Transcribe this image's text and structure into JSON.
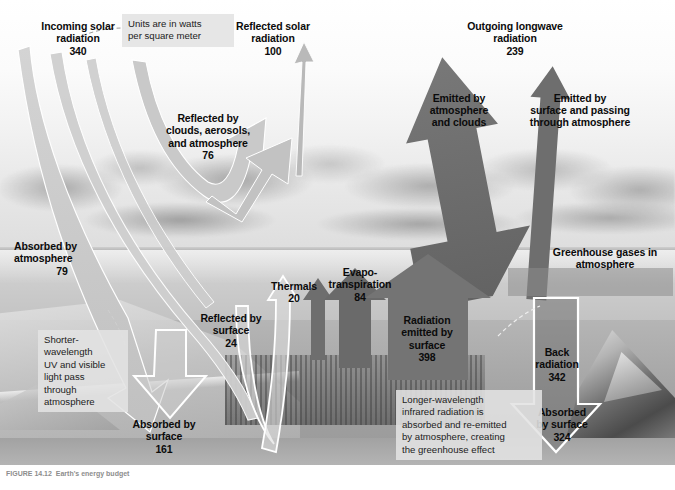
{
  "figure": {
    "units_note": "Units are in watts\nper square meter",
    "caption": "FIGURE 14.12  Earth's energy budget",
    "colors": {
      "incoming_solar_arrow": "#c9c9c9",
      "reflected_solar_arrow": "#c4c4c4",
      "longwave_arrow": "#6e6e6e",
      "surface_emission_arrow": "#7a7a7a",
      "back_radiation_outline": "#ffffff",
      "note_box": "#e2e2e2",
      "label_text": "#0b0b0b"
    }
  },
  "flows": [
    {
      "id": "incoming-solar",
      "label": "Incoming solar\nradiation",
      "value": "340",
      "direction": "down",
      "tone": "light"
    },
    {
      "id": "reflected-solar",
      "label": "Reflected solar\nradiation",
      "value": "100",
      "direction": "up",
      "tone": "light"
    },
    {
      "id": "reflected-by-clouds",
      "label": "Reflected by\nclouds, aerosols,\nand atmosphere",
      "value": "76",
      "direction": "up",
      "tone": "light"
    },
    {
      "id": "outgoing-longwave",
      "label": "Outgoing longwave\nradiation",
      "value": "239",
      "direction": "up",
      "tone": "dark"
    },
    {
      "id": "emitted-by-atmosphere",
      "label": "Emitted by\natmosphere\nand clouds",
      "value": "",
      "direction": "up",
      "tone": "dark"
    },
    {
      "id": "emitted-by-surface-passing",
      "label": "Emitted by\nsurface and passing\nthrough atmosphere",
      "value": "",
      "direction": "up",
      "tone": "dark"
    },
    {
      "id": "absorbed-by-atmosphere",
      "label": "Absorbed by\natmosphere",
      "value": "79",
      "direction": "none",
      "tone": "light"
    },
    {
      "id": "reflected-by-surface",
      "label": "Reflected by\nsurface",
      "value": "24",
      "direction": "up",
      "tone": "light"
    },
    {
      "id": "absorbed-by-surface-solar",
      "label": "Absorbed by\nsurface",
      "value": "161",
      "direction": "down",
      "tone": "light"
    },
    {
      "id": "thermals",
      "label": "Thermals",
      "value": "20",
      "direction": "up",
      "tone": "dark"
    },
    {
      "id": "evapotranspiration",
      "label": "Evapo-\ntranspiration",
      "value": "84",
      "direction": "up",
      "tone": "dark"
    },
    {
      "id": "radiation-emitted-by-surface",
      "label": "Radiation\nemitted by\nsurface",
      "value": "398",
      "direction": "up",
      "tone": "dark"
    },
    {
      "id": "greenhouse-gases",
      "label": "Greenhouse gases in\natmosphere",
      "value": "",
      "direction": "none",
      "tone": "dark"
    },
    {
      "id": "back-radiation",
      "label": "Back\nradiation",
      "value": "342",
      "direction": "down",
      "tone": "outline"
    },
    {
      "id": "absorbed-by-surface-back",
      "label": "Absorbed\nby surface",
      "value": "324",
      "direction": "down",
      "tone": "outline"
    }
  ],
  "notes": [
    {
      "id": "shortwave-note",
      "text": "Shorter-\nwavelength\nUV and visible\nlight pass\nthrough\natmosphere"
    },
    {
      "id": "longwave-note",
      "text": "Longer-wavelength\ninfrared radiation is\nabsorbed and re-emitted\nby atmosphere, creating\nthe greenhouse effect"
    }
  ]
}
